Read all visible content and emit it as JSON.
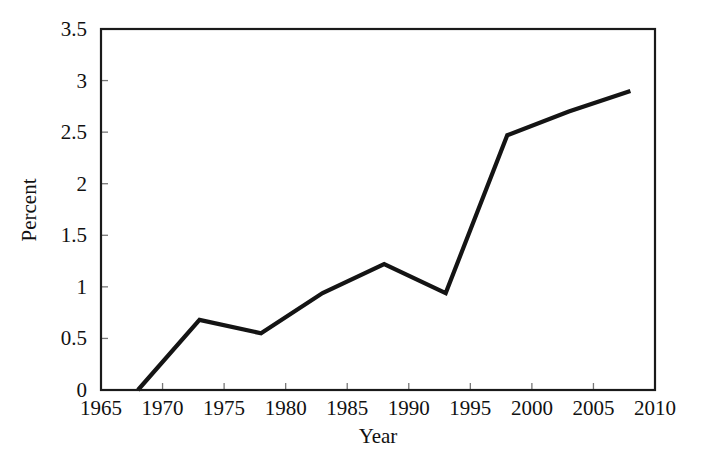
{
  "chart_data": {
    "type": "line",
    "title": "",
    "subtitle": "",
    "xlabel": "Year",
    "ylabel": "Percent",
    "xlim": [
      1965,
      2010
    ],
    "ylim": [
      0,
      3.5
    ],
    "grid": false,
    "legend": null,
    "legend_position": "none",
    "x_ticks": [
      1965,
      1970,
      1975,
      1980,
      1985,
      1990,
      1995,
      2000,
      2005,
      2010
    ],
    "x_tick_labels": [
      "1965",
      "1970",
      "1975",
      "1980",
      "1985",
      "1990",
      "1995",
      "2000",
      "2005",
      "2010"
    ],
    "y_ticks": [
      0,
      0.5,
      1,
      1.5,
      2,
      2.5,
      3,
      3.5
    ],
    "y_tick_labels": [
      "0",
      "0.5",
      "1",
      "1.5",
      "2",
      "2.5",
      "3",
      "3.5"
    ],
    "series": [
      {
        "name": "Percent",
        "color": "#141414",
        "x": [
          1968,
          1973,
          1978,
          1983,
          1988,
          1993,
          1998,
          2003,
          2008
        ],
        "values": [
          0,
          0.68,
          0.55,
          0.94,
          1.22,
          0.94,
          2.47,
          2.7,
          2.9
        ]
      }
    ],
    "annotations": []
  },
  "style": {
    "line_color": "#141414",
    "frame_color": "#1a1a1a",
    "text_color": "#111111",
    "background": "#ffffff"
  }
}
